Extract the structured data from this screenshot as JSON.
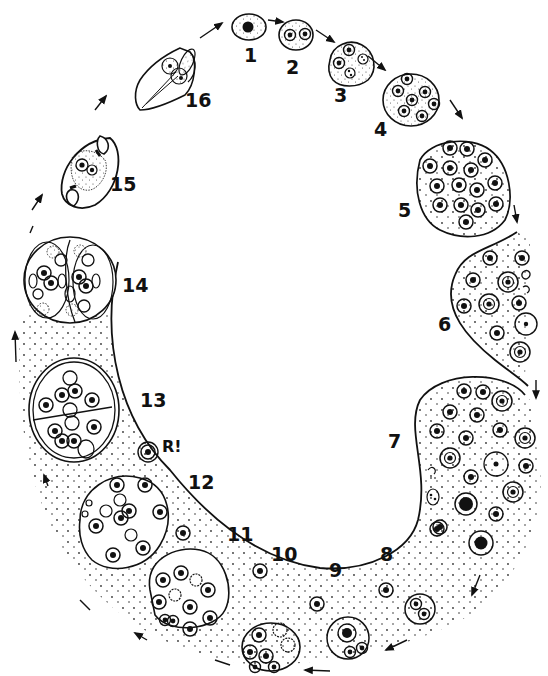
{
  "diagram": {
    "type": "life-cycle illustration",
    "style": "black ink line drawing, stippled cytoplasm",
    "colors": {
      "ink": "#111111",
      "background": "#ffffff",
      "stipple": "#333333"
    },
    "flow_direction": "clockwise",
    "stages": [
      {
        "id": "1",
        "label": "1",
        "x": 248,
        "y": 47
      },
      {
        "id": "2",
        "label": "2",
        "x": 291,
        "y": 59
      },
      {
        "id": "3",
        "label": "3",
        "x": 340,
        "y": 86
      },
      {
        "id": "4",
        "label": "4",
        "x": 379,
        "y": 120
      },
      {
        "id": "5",
        "label": "5",
        "x": 403,
        "y": 202
      },
      {
        "id": "6",
        "label": "6",
        "x": 443,
        "y": 316
      },
      {
        "id": "7",
        "label": "7",
        "x": 393,
        "y": 433
      },
      {
        "id": "8",
        "label": "8",
        "x": 385,
        "y": 546
      },
      {
        "id": "9",
        "label": "9",
        "x": 334,
        "y": 562
      },
      {
        "id": "10",
        "label": "10",
        "x": 276,
        "y": 546
      },
      {
        "id": "11",
        "label": "11",
        "x": 232,
        "y": 526
      },
      {
        "id": "12",
        "label": "12",
        "x": 193,
        "y": 474
      },
      {
        "id": "13",
        "label": "13",
        "x": 145,
        "y": 392
      },
      {
        "id": "14",
        "label": "14",
        "x": 127,
        "y": 277
      },
      {
        "id": "15",
        "label": "15",
        "x": 115,
        "y": 176
      },
      {
        "id": "16",
        "label": "16",
        "x": 190,
        "y": 92
      }
    ],
    "annotation": {
      "label": "R!",
      "x": 166,
      "y": 439
    }
  }
}
